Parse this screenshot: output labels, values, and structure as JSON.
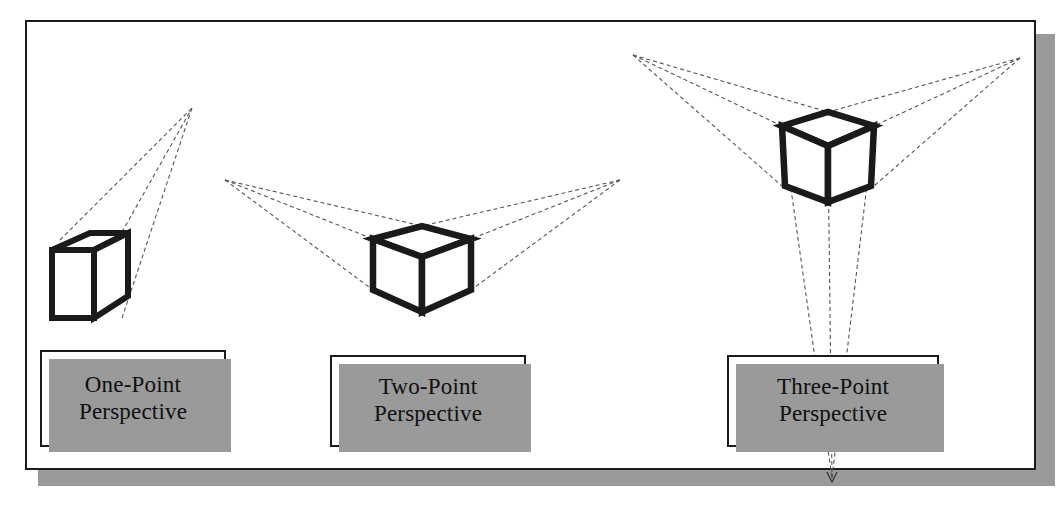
{
  "diagram": {
    "background_color": "#ffffff",
    "frame": {
      "border_color": "#1c1c1c",
      "shadow_color": "#9a9a9a"
    },
    "stroke_colors": {
      "cube_edge": "#1a1a1a",
      "construction_line": "#555555"
    },
    "panels": [
      {
        "id": "one-point",
        "label_line_1": "One-Point",
        "label_line_2": "Perspective",
        "vanishing_points": 1,
        "vanishing_point_coords": [
          [
            192,
            108
          ]
        ],
        "cube_center": [
          92,
          268
        ]
      },
      {
        "id": "two-point",
        "label_line_1": "Two-Point",
        "label_line_2": "Perspective",
        "vanishing_points": 2,
        "vanishing_point_coords": [
          [
            225,
            180
          ],
          [
            620,
            180
          ]
        ],
        "cube_center": [
          422,
          262
        ]
      },
      {
        "id": "three-point",
        "label_line_1": "Three-Point",
        "label_line_2": "Perspective",
        "vanishing_points": 3,
        "vanishing_point_coords": [
          [
            633,
            55
          ],
          [
            1020,
            58
          ],
          [
            832,
            478
          ]
        ],
        "cube_center": [
          828,
          152
        ]
      }
    ]
  }
}
